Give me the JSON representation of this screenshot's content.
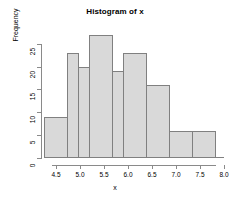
{
  "chart_data": {
    "type": "bar",
    "title": "Histogram of x",
    "xlabel": "x",
    "ylabel": "Frequency",
    "categories": [
      "4.25-4.5",
      "4.5-5.0",
      "5.0-5.25",
      "5.25-5.75",
      "5.75-6.0",
      "6.0-6.5",
      "6.5-7.0",
      "7.0-7.5",
      "7.5-8.0"
    ],
    "bin_edges": [
      4.25,
      4.75,
      5.0,
      5.25,
      5.75,
      6.0,
      6.5,
      7.0,
      7.5,
      8.0
    ],
    "values": [
      9,
      23,
      20,
      27,
      19,
      23,
      16,
      6,
      6
    ],
    "xlim": [
      4.25,
      8.0
    ],
    "ylim": [
      0,
      28
    ],
    "xticks": [
      "4.5",
      "5.0",
      "5.5",
      "6.0",
      "6.5",
      "7.0",
      "7.5",
      "8.0"
    ],
    "xtick_values": [
      4.5,
      5.0,
      5.5,
      6.0,
      6.5,
      7.0,
      7.5,
      8.0
    ],
    "yticks": [
      "0",
      "5",
      "10",
      "15",
      "20",
      "25"
    ],
    "ytick_values": [
      0,
      5,
      10,
      15,
      20,
      25
    ],
    "grid": false,
    "legend": null,
    "bar_fill": "#d9d9d9",
    "bar_border": "#808080",
    "background": "#ffffff"
  }
}
